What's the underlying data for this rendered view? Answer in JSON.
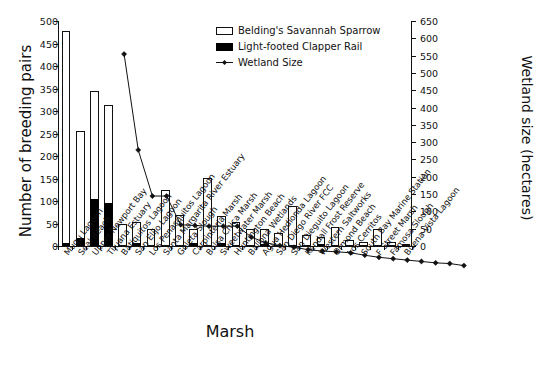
{
  "chart_data": {
    "type": "bar",
    "title": "",
    "xlabel": "Marsh",
    "ylabel": "Number of breeding pairs",
    "ylabel_secondary": "Wetland size (hectares)",
    "ylim": [
      0,
      500
    ],
    "ylim_secondary": [
      0,
      650
    ],
    "yticks": [
      0,
      50,
      100,
      150,
      200,
      250,
      300,
      350,
      400,
      450,
      500
    ],
    "yticks_secondary": [
      0,
      50,
      100,
      150,
      200,
      250,
      300,
      350,
      400,
      450,
      500,
      550,
      600,
      650
    ],
    "grid": false,
    "legend_position": "top-right",
    "stacked": true,
    "categories": [
      "Mugu Lagoon",
      "Seal Beach",
      "Upper Newport Bay",
      "Tijuana Estuary",
      "Batiquitos Lagoon",
      "San Elijo Lagoon",
      "Los Penasquitos Lagoon",
      "Santa Margarita River Estuary",
      "Goleta Slough",
      "Carpinteria Marsh",
      "Bolsa Chica Marsh",
      "Sweetwater Marsh",
      "Huntington Beach",
      "Ballona Wetlands",
      "Agua Hedionda Lagoon",
      "San Diego River FCC",
      "San Dieguito Lagoon",
      "Kendall Frost Reserve",
      "Western Saltworks",
      "Ormond Beach",
      "Los Cerritos",
      "South Bay Marine Station",
      "F Street Marsh",
      "Famosa Slough",
      "Buena Vista Lagoon"
    ],
    "series": [
      {
        "name": "Belding's Savannah Sparrow",
        "style": "open-bar",
        "values": [
          472,
          238,
          240,
          218,
          50,
          47,
          37,
          125,
          68,
          32,
          152,
          60,
          53,
          38,
          33,
          30,
          88,
          25,
          18,
          42,
          14,
          10,
          38,
          8,
          5
        ]
      },
      {
        "name": "Light-footed Clapper Rail",
        "style": "filled-bar",
        "values": [
          6,
          18,
          105,
          95,
          0,
          6,
          0,
          0,
          0,
          6,
          0,
          7,
          0,
          0,
          4,
          0,
          0,
          0,
          3,
          0,
          0,
          0,
          0,
          0,
          0
        ]
      },
      {
        "name": "Wetland Size",
        "style": "line-marker",
        "axis": "secondary",
        "units": "hectares",
        "values": [
          615,
          338,
          205,
          205,
          122,
          120,
          118,
          118,
          118,
          86,
          70,
          62,
          57,
          50,
          46,
          44,
          41,
          34,
          28,
          24,
          20,
          16,
          12,
          10,
          4
        ]
      }
    ]
  },
  "legend": {
    "items": [
      {
        "label": "Belding's Savannah Sparrow",
        "swatch": "open-rect-swatch"
      },
      {
        "label": "Light-footed Clapper Rail",
        "swatch": "filled-rect-swatch"
      },
      {
        "label": "Wetland Size",
        "swatch": "line-diamond-swatch"
      }
    ]
  }
}
